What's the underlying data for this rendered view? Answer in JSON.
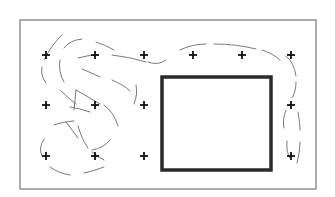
{
  "diagram": {
    "type": "grid-with-obstacle-and-path",
    "frame": {
      "x": 20,
      "y": 20,
      "width": 296,
      "height": 169,
      "color": "#8a8a8a"
    },
    "obstacle": {
      "shape": "square",
      "x": 162,
      "y": 77,
      "width": 109,
      "height": 93,
      "color": "#2a2a2a"
    },
    "grid_markers": {
      "symbol": "+",
      "color": "#111111",
      "columns_x": [
        46,
        95,
        144,
        193,
        242,
        291
      ],
      "rows_y": [
        55,
        105,
        156
      ],
      "points": [
        {
          "x": 46,
          "y": 55
        },
        {
          "x": 95,
          "y": 55
        },
        {
          "x": 144,
          "y": 55
        },
        {
          "x": 193,
          "y": 55
        },
        {
          "x": 242,
          "y": 55
        },
        {
          "x": 291,
          "y": 55
        },
        {
          "x": 46,
          "y": 105
        },
        {
          "x": 95,
          "y": 105
        },
        {
          "x": 144,
          "y": 105
        },
        {
          "x": 291,
          "y": 105
        },
        {
          "x": 46,
          "y": 156
        },
        {
          "x": 95,
          "y": 156
        },
        {
          "x": 144,
          "y": 156
        },
        {
          "x": 291,
          "y": 156
        }
      ]
    },
    "path": {
      "style": "dashed",
      "color": "#7a7a7a",
      "segments": [
        "M 62 35 Q 52 44 44 60",
        "M 42 67 Q 40 75 46 83",
        "M 64 48 Q 70 40 82 39",
        "M 60 60 Q 58 72 64 82",
        "M 96 42 Q 106 45 114 50",
        "M 78 58 Q 88 55 98 55",
        "M 112 55 Q 130 57 146 62",
        "M 148 62 Q 158 66 166 60",
        "M 82 69 Q 92 73 100 77",
        "M 112 80 Q 124 85 130 91",
        "M 180 50 Q 192 44 206 44",
        "M 214 44 Q 236 44 256 49",
        "M 262 50 Q 272 53 280 60",
        "M 286 56 Q 294 62 296 76",
        "M 296 82 Q 296 92 292 98",
        "M 60 90 Q 68 98 76 104",
        "M 76 90 L 74 110",
        "M 76 90 Q 90 98 100 104",
        "M 70 107 Q 78 108 90 112",
        "M 104 105 Q 114 112 118 126",
        "M 54 125 Q 62 122 74 121",
        "M 66 122 Q 72 130 78 138",
        "M 78 126 Q 82 140 88 148",
        "M 44 139 Q 38 148 42 156",
        "M 110 140 Q 104 148 92 150",
        "M 92 152 Q 98 157 104 160",
        "M 50 167 Q 58 173 70 175",
        "M 84 173 Q 94 171 104 167",
        "M 134 104 Q 138 94 136 85",
        "M 286 110 Q 282 120 284 128",
        "M 298 112 Q 300 124 300 130",
        "M 287 141 Q 286 152 290 158",
        "M 300 142 Q 300 152 297 163"
      ]
    }
  }
}
